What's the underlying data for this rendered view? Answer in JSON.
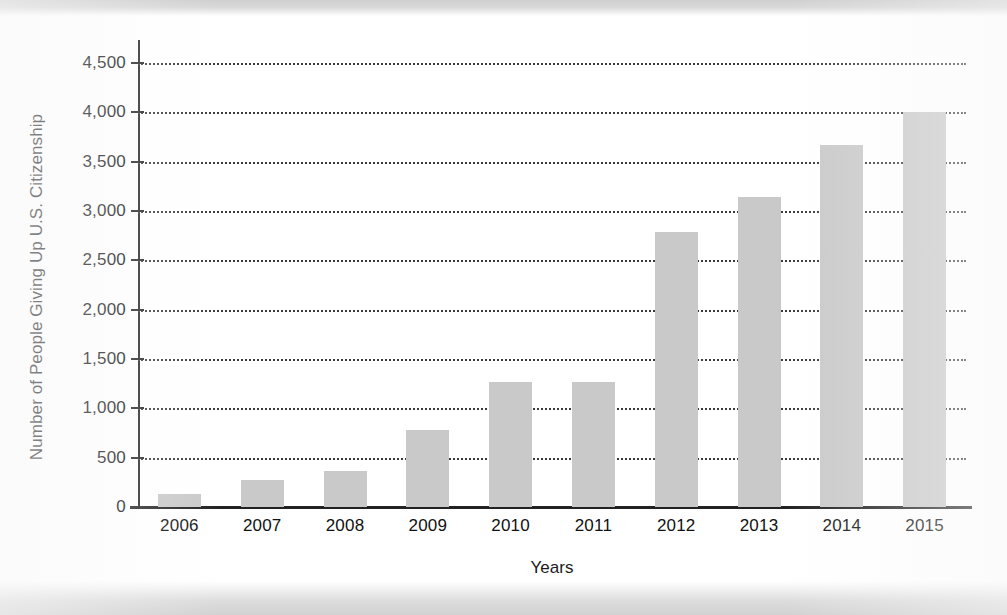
{
  "chart_data": {
    "type": "bar",
    "title": "",
    "xlabel": "Years",
    "ylabel": "Number of People Giving Up U.S. Citizenship",
    "categories": [
      "2006",
      "2007",
      "2008",
      "2009",
      "2010",
      "2011",
      "2012",
      "2013",
      "2014",
      "2015"
    ],
    "values": [
      130,
      270,
      360,
      780,
      1270,
      1270,
      2790,
      3140,
      3670,
      4000
    ],
    "ylim": [
      0,
      4500
    ],
    "ytick_values": [
      0,
      500,
      1000,
      1500,
      2000,
      2500,
      3000,
      3500,
      4000,
      4500
    ],
    "ytick_labels": [
      "0",
      "500",
      "1,000",
      "1,500",
      "2,000",
      "2,500",
      "3,000",
      "3,500",
      "4,000",
      "4,500"
    ],
    "grid": "horizontal-dotted",
    "legend": "none",
    "bar_color": "#c9c9c9",
    "axis_color": "#222222",
    "grid_color": "#3a3a3a",
    "background_color": "#ffffff"
  }
}
